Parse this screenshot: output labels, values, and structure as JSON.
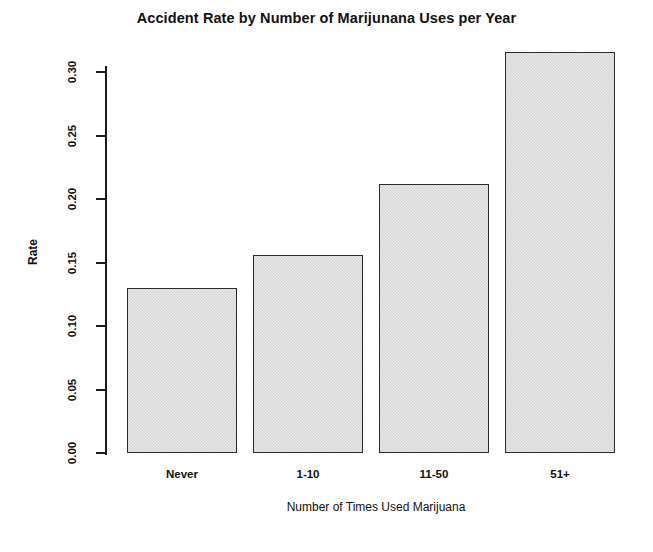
{
  "chart_data": {
    "type": "bar",
    "title": "Accident Rate by Number of Marijunana Uses per Year",
    "xlabel": "Number of Times Used Marijuana",
    "ylabel": "Rate",
    "categories": [
      "Never",
      "1-10",
      "11-50",
      "51+"
    ],
    "values": [
      0.13,
      0.156,
      0.212,
      0.316
    ],
    "ylim": [
      0.0,
      0.32
    ],
    "yticks": [
      0.0,
      0.05,
      0.1,
      0.15,
      0.2,
      0.25,
      0.3
    ],
    "ytick_labels": [
      "0.00",
      "0.05",
      "0.10",
      "0.15",
      "0.20",
      "0.25",
      "0.30"
    ],
    "grid": false,
    "legend": false,
    "bar_fill_color": "#d2d2d2",
    "bar_border_color": "#2b2b2b",
    "axis_color": "#1d1d1d",
    "text_color": "#111111",
    "background_color": "#ffffff",
    "ytick_label_rotation": -90,
    "ylabel_rotation": -90
  }
}
